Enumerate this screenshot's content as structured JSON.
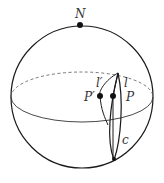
{
  "diagram": {
    "type": "sphere-geodesics",
    "labels": {
      "north_pole": "N",
      "point_p": "P",
      "point_p_prime": "P′",
      "line_l": "l",
      "line_l_prime": "l′",
      "curve_c": "c"
    },
    "colors": {
      "stroke": "#1a1a1a",
      "label": "#333333",
      "background": "#ffffff"
    }
  }
}
